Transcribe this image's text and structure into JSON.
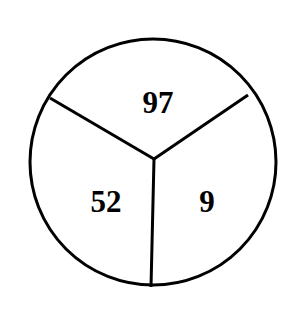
{
  "diagram": {
    "shape": "circle divided into three sectors",
    "sectors": [
      {
        "position": "top",
        "value": "97"
      },
      {
        "position": "bottom-left",
        "value": "52"
      },
      {
        "position": "bottom-right",
        "value": "9"
      }
    ],
    "colors": {
      "stroke": "#000000",
      "background": "#ffffff"
    }
  }
}
